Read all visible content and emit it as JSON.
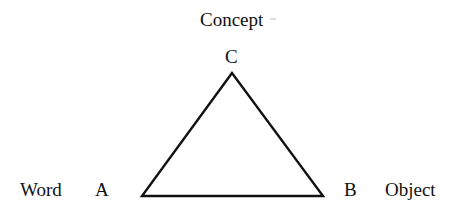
{
  "diagram": {
    "vertices": {
      "top": {
        "letter": "C",
        "label": "Concept"
      },
      "left": {
        "letter": "A",
        "label": "Word"
      },
      "right": {
        "letter": "B",
        "label": "Object"
      }
    },
    "stroke_color": "#111111",
    "background": "#ffffff"
  }
}
